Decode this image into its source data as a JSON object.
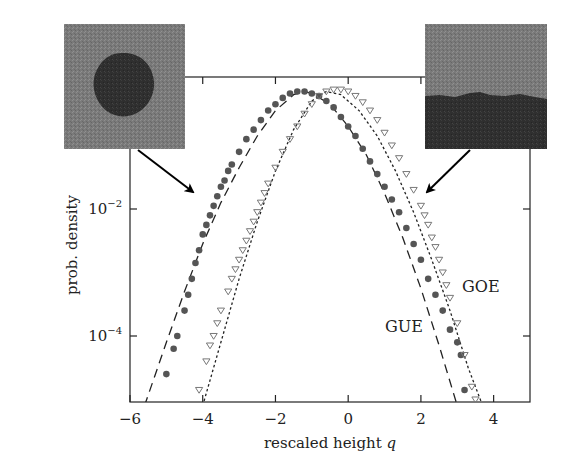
{
  "chart_data": {
    "type": "scatter",
    "title": "",
    "xlabel": "rescaled height",
    "xlabel_var": "q",
    "ylabel": "prob. density",
    "xlim": [
      -6,
      5
    ],
    "ylim_log10": [
      -5.1,
      0.1
    ],
    "yscale": "log",
    "x_ticks": [
      -6,
      -4,
      -2,
      0,
      2,
      4
    ],
    "x_tick_labels": [
      "−6",
      "−4",
      "−2",
      "0",
      "2",
      "4"
    ],
    "y_ticks_log10": [
      0,
      -2,
      -4
    ],
    "y_tick_labels": [
      {
        "base": "10",
        "exp": "0"
      },
      {
        "base": "10",
        "exp": "−2"
      },
      {
        "base": "10",
        "exp": "−4"
      }
    ],
    "grid": false,
    "annotations": [
      {
        "text": "GUE",
        "x": 1.0,
        "log10y": -3.95
      },
      {
        "text": "GOE",
        "x": 2.3,
        "log10y": -3.25
      }
    ],
    "insets": [
      {
        "name": "circular-interface-image",
        "description": "dark circular cluster on grey background",
        "points_to": "GUE"
      },
      {
        "name": "flat-interface-image",
        "description": "dark lower half with rough boundary on grey background",
        "points_to": "GOE"
      }
    ],
    "series": [
      {
        "name": "GUE theory",
        "style": "dashed",
        "color": "#222222",
        "x": [
          -5.6,
          -5.0,
          -4.5,
          -4.0,
          -3.5,
          -3.0,
          -2.5,
          -2.0,
          -1.5,
          -1.2,
          -1.0,
          -0.5,
          0.0,
          0.5,
          1.0,
          1.5,
          2.0,
          2.5,
          3.0
        ],
        "log10y": [
          -5.1,
          -4.1,
          -3.3,
          -2.55,
          -1.9,
          -1.35,
          -0.85,
          -0.45,
          -0.2,
          -0.15,
          -0.18,
          -0.35,
          -0.7,
          -1.15,
          -1.75,
          -2.45,
          -3.25,
          -4.15,
          -5.1
        ]
      },
      {
        "name": "GOE theory",
        "style": "dotted",
        "color": "#222222",
        "x": [
          -4.0,
          -3.5,
          -3.0,
          -2.5,
          -2.0,
          -1.5,
          -1.0,
          -0.6,
          -0.2,
          0.3,
          0.8,
          1.3,
          1.8,
          2.3,
          2.8,
          3.3,
          3.7
        ],
        "log10y": [
          -5.1,
          -4.1,
          -3.1,
          -2.2,
          -1.4,
          -0.75,
          -0.3,
          -0.15,
          -0.2,
          -0.45,
          -0.85,
          -1.4,
          -2.05,
          -2.8,
          -3.6,
          -4.5,
          -5.1
        ]
      },
      {
        "name": "circular data (GUE)",
        "marker": "filled-circle",
        "color": "#555555",
        "x": [
          -5.0,
          -4.8,
          -4.7,
          -4.5,
          -4.4,
          -4.3,
          -4.2,
          -4.1,
          -4.0,
          -3.9,
          -3.8,
          -3.7,
          -3.6,
          -3.5,
          -3.4,
          -3.3,
          -3.2,
          -3.0,
          -2.8,
          -2.6,
          -2.4,
          -2.2,
          -2.0,
          -1.8,
          -1.6,
          -1.4,
          -1.2,
          -1.0,
          -0.8,
          -0.6,
          -0.4,
          -0.2,
          0.0,
          0.2,
          0.4,
          0.6,
          0.8,
          1.0,
          1.2,
          1.4,
          1.6,
          1.8,
          2.0,
          2.2,
          2.4,
          2.6,
          2.8,
          3.0,
          3.1,
          3.2
        ],
        "log10y": [
          -4.6,
          -4.2,
          -4.0,
          -3.6,
          -3.35,
          -3.1,
          -2.85,
          -2.65,
          -2.4,
          -2.25,
          -2.1,
          -1.95,
          -1.8,
          -1.65,
          -1.55,
          -1.4,
          -1.3,
          -1.1,
          -0.9,
          -0.75,
          -0.6,
          -0.45,
          -0.35,
          -0.25,
          -0.18,
          -0.15,
          -0.15,
          -0.18,
          -0.22,
          -0.3,
          -0.4,
          -0.55,
          -0.7,
          -0.85,
          -1.05,
          -1.25,
          -1.45,
          -1.65,
          -1.85,
          -2.05,
          -2.3,
          -2.55,
          -2.8,
          -3.1,
          -3.35,
          -3.6,
          -3.9,
          -4.1,
          -4.3,
          -4.85
        ]
      },
      {
        "name": "flat data (GOE)",
        "marker": "open-triangle-down",
        "color": "#777777",
        "x": [
          -4.1,
          -3.9,
          -3.8,
          -3.7,
          -3.6,
          -3.5,
          -3.3,
          -3.2,
          -3.1,
          -3.0,
          -2.9,
          -2.8,
          -2.7,
          -2.6,
          -2.5,
          -2.4,
          -2.3,
          -2.2,
          -2.0,
          -1.8,
          -1.6,
          -1.4,
          -1.2,
          -1.0,
          -0.8,
          -0.6,
          -0.4,
          -0.2,
          0.0,
          0.2,
          0.4,
          0.6,
          0.8,
          1.0,
          1.2,
          1.4,
          1.6,
          1.8,
          2.0,
          2.1,
          2.2,
          2.3,
          2.4,
          2.5,
          2.6,
          2.7,
          2.8,
          3.0,
          3.2,
          3.4,
          3.5
        ],
        "log10y": [
          -4.85,
          -4.4,
          -4.15,
          -4.0,
          -3.8,
          -3.6,
          -3.3,
          -3.1,
          -2.95,
          -2.8,
          -2.65,
          -2.5,
          -2.35,
          -2.2,
          -2.05,
          -1.9,
          -1.75,
          -1.6,
          -1.35,
          -1.1,
          -0.9,
          -0.7,
          -0.5,
          -0.35,
          -0.22,
          -0.15,
          -0.12,
          -0.12,
          -0.15,
          -0.22,
          -0.32,
          -0.45,
          -0.6,
          -0.8,
          -1.0,
          -1.2,
          -1.45,
          -1.7,
          -1.95,
          -2.1,
          -2.25,
          -2.45,
          -2.6,
          -2.8,
          -3.0,
          -3.2,
          -3.4,
          -3.8,
          -4.3,
          -4.8,
          -5.0
        ]
      }
    ]
  }
}
